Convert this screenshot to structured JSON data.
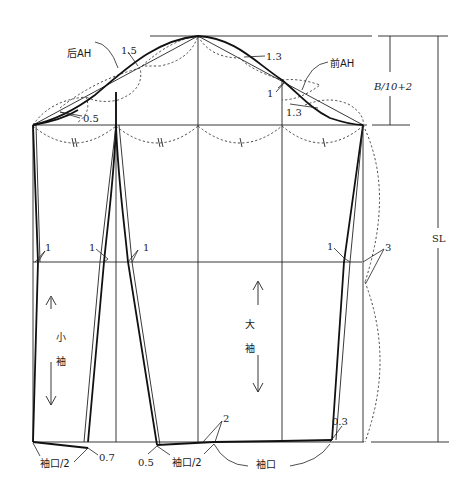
{
  "diagram": {
    "colors": {
      "line": "#111111",
      "background": "#ffffff"
    },
    "labels": {
      "back_armhole": "后AH",
      "front_armhole": "前AH",
      "cap_height_formula": "B/10+2",
      "sleeve_length": "SL",
      "undersleeve_char1": "小",
      "undersleeve_char2": "袖",
      "topsleeve_char1": "大",
      "topsleeve_char2": "袖",
      "cuff_half_left": "袖口/2",
      "cuff_half_mid": "袖口/2",
      "cuff": "袖口"
    },
    "measurements": {
      "back_cap_offset": "1.5",
      "front_cap_offset_upper": "1.3",
      "front_cap_offset_lower": "1.3",
      "front_notch_offset": "1",
      "back_underarm_offset": "0.5",
      "elbow_left": "1",
      "elbow_under_left": "1",
      "elbow_under_right": "1",
      "elbow_top_right": "1",
      "side_offset": "3",
      "hem_under_left": "0.7",
      "hem_under_right": "0.5",
      "hem_top_left": "2",
      "hem_top_right": "0.3"
    }
  }
}
